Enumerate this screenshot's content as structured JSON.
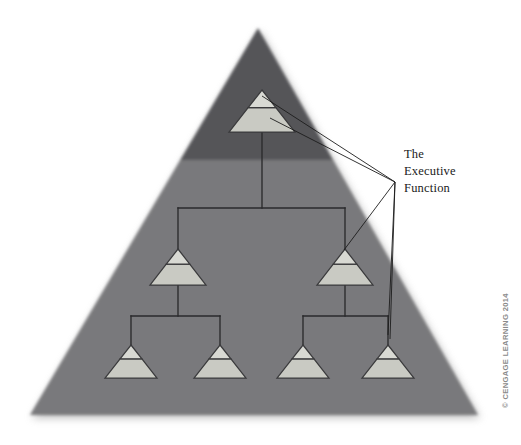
{
  "figure": {
    "name": "executive-function-hierarchy",
    "background_color": "#ffffff",
    "width": 521,
    "height": 445
  },
  "colors": {
    "big_triangle_dark": "#555558",
    "big_triangle_light": "#79797c",
    "node_top_fill": "#d8d9d3",
    "node_bottom_fill": "#c9cac3",
    "node_stroke": "#3a3a3c",
    "leader_line": "#1c1c1c",
    "connector_line": "#2a2a2c",
    "label_color": "#1a1a1a",
    "credit_color": "#8a8a8a",
    "shadow_color": "#bdbdbd"
  },
  "backdrop": {
    "name": "large-background-triangle",
    "apex": {
      "x": 258,
      "y": 28
    },
    "base_left": {
      "x": 30,
      "y": 415
    },
    "base_right": {
      "x": 478,
      "y": 415
    },
    "shade_split_y": 160,
    "description": "Large grey triangle, darker above the split line and lighter below"
  },
  "annotation": {
    "label_lines": [
      "The",
      "Executive",
      "Function"
    ],
    "label_x": 404,
    "label_y_start": 158,
    "label_line_height": 17,
    "leader_converge": {
      "x": 395,
      "y": 182
    },
    "leader_targets": [
      {
        "node": "root",
        "x": 262,
        "y": 96
      },
      {
        "node": "mid-right",
        "x": 344,
        "y": 250
      },
      {
        "node": "leaf-4",
        "x": 388,
        "y": 335
      }
    ]
  },
  "credit": {
    "text": "© CENGAGE LEARNING 2014",
    "x": 508,
    "y": 408,
    "rotation": -90
  },
  "chart_data": {
    "type": "tree",
    "levels": 3,
    "nodes": [
      {
        "id": "root",
        "level": 0,
        "cx": 262,
        "base_y": 132,
        "half_width": 33,
        "height": 42,
        "split_ratio": 0.42,
        "labelled": true
      },
      {
        "id": "mid-left",
        "level": 1,
        "cx": 178,
        "base_y": 285,
        "half_width": 28,
        "height": 36,
        "split_ratio": 0.42,
        "labelled": false
      },
      {
        "id": "mid-right",
        "level": 1,
        "cx": 345,
        "base_y": 285,
        "half_width": 28,
        "height": 36,
        "split_ratio": 0.42,
        "labelled": true
      },
      {
        "id": "leaf-1",
        "level": 2,
        "cx": 131,
        "base_y": 378,
        "half_width": 26,
        "height": 33,
        "split_ratio": 0.42,
        "labelled": false
      },
      {
        "id": "leaf-2",
        "level": 2,
        "cx": 220,
        "base_y": 378,
        "half_width": 26,
        "height": 33,
        "split_ratio": 0.42,
        "labelled": false
      },
      {
        "id": "leaf-3",
        "level": 2,
        "cx": 303,
        "base_y": 378,
        "half_width": 26,
        "height": 33,
        "split_ratio": 0.42,
        "labelled": false
      },
      {
        "id": "leaf-4",
        "level": 2,
        "cx": 388,
        "base_y": 378,
        "half_width": 26,
        "height": 33,
        "split_ratio": 0.42,
        "labelled": true
      }
    ],
    "edges": [
      {
        "from": "root",
        "to": "mid-left"
      },
      {
        "from": "root",
        "to": "mid-right"
      },
      {
        "from": "mid-left",
        "to": "leaf-1"
      },
      {
        "from": "mid-left",
        "to": "leaf-2"
      },
      {
        "from": "mid-right",
        "to": "leaf-3"
      },
      {
        "from": "mid-right",
        "to": "leaf-4"
      }
    ],
    "connector_rows": [
      {
        "name": "root-to-mid-bar",
        "y": 208,
        "x1": 178,
        "x2": 345,
        "stem_from_y": 132,
        "stem_x": 262
      },
      {
        "name": "midleft-to-leaf-bar",
        "y": 316,
        "x1": 131,
        "x2": 220,
        "stem_from_y": 285,
        "stem_x": 178
      },
      {
        "name": "midright-to-leaf-bar",
        "y": 316,
        "x1": 303,
        "x2": 388,
        "stem_from_y": 285,
        "stem_x": 345
      }
    ]
  }
}
